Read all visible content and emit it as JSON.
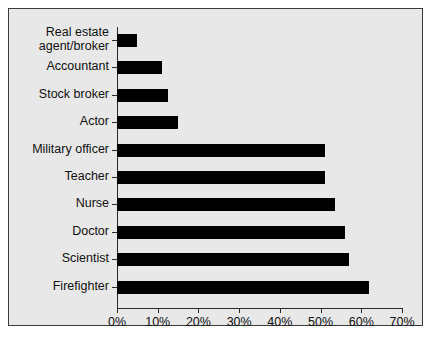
{
  "chart_data": {
    "type": "bar",
    "orientation": "horizontal",
    "title": "",
    "xlabel": "",
    "ylabel": "",
    "xlim": [
      0,
      70
    ],
    "xtick_labels": [
      "0%",
      "10%",
      "20%",
      "30%",
      "40%",
      "50%",
      "60%",
      "70%"
    ],
    "xtick_values": [
      0,
      10,
      20,
      30,
      40,
      50,
      60,
      70
    ],
    "grid": false,
    "legend": false,
    "bar_color": "#000000",
    "panel_color": "#e8e8e8",
    "border_color": "#3a3a3a",
    "categories": [
      "Real estate agent/broker",
      "Accountant",
      "Stock broker",
      "Actor",
      "Military officer",
      "Teacher",
      "Nurse",
      "Doctor",
      "Scientist",
      "Firefighter"
    ],
    "values": [
      5,
      11,
      12.5,
      15,
      51,
      51,
      53.5,
      56,
      57,
      62
    ],
    "bars": [
      {
        "label_line1": "Real estate",
        "label_line2": "agent/broker",
        "value": 5
      },
      {
        "label_line1": "Accountant",
        "label_line2": "",
        "value": 11
      },
      {
        "label_line1": "Stock broker",
        "label_line2": "",
        "value": 12.5
      },
      {
        "label_line1": "Actor",
        "label_line2": "",
        "value": 15
      },
      {
        "label_line1": "Military officer",
        "label_line2": "",
        "value": 51
      },
      {
        "label_line1": "Teacher",
        "label_line2": "",
        "value": 51
      },
      {
        "label_line1": "Nurse",
        "label_line2": "",
        "value": 53.5
      },
      {
        "label_line1": "Doctor",
        "label_line2": "",
        "value": 56
      },
      {
        "label_line1": "Scientist",
        "label_line2": "",
        "value": 57
      },
      {
        "label_line1": "Firefighter",
        "label_line2": "",
        "value": 62
      }
    ]
  }
}
